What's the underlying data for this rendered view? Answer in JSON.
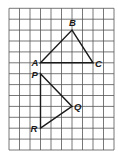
{
  "grid": {
    "origin_x": 9,
    "origin_y": 8.3,
    "cell_w": 10.5,
    "cell_h": 10.9,
    "cols": 10,
    "rows": 13,
    "line_color": "#555555"
  },
  "triangles": [
    {
      "name": "triangle-abc",
      "vertices": [
        {
          "label": "A",
          "col": 3,
          "row": 5,
          "label_dx": -9,
          "label_dy": 3
        },
        {
          "label": "B",
          "col": 6,
          "row": 2,
          "label_dx": -3,
          "label_dy": -4
        },
        {
          "label": "C",
          "col": 8,
          "row": 5,
          "label_dx": 2,
          "label_dy": 4
        }
      ]
    },
    {
      "name": "triangle-pqr",
      "vertices": [
        {
          "label": "P",
          "col": 3,
          "row": 6,
          "label_dx": -9,
          "label_dy": 4
        },
        {
          "label": "Q",
          "col": 6,
          "row": 9,
          "label_dx": 2,
          "label_dy": 4
        },
        {
          "label": "R",
          "col": 3,
          "row": 11,
          "label_dx": -10,
          "label_dy": 4
        }
      ]
    }
  ]
}
